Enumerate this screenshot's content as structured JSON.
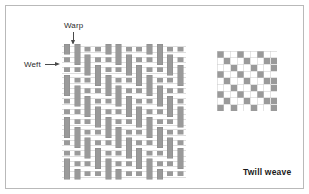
{
  "figure": {
    "caption": "Twill weave",
    "background_color": "#ffffff",
    "border_color": "#b9b9b9",
    "thread_color": "#9a9a9a",
    "thread_outline_color": "#8a8a8a",
    "grid_line_color": "#c9c9c9",
    "weft_line_color": "#bdbdbd",
    "text_color": "#2b2b2b"
  },
  "labels": {
    "warp": "Warp",
    "weft": "Weft"
  },
  "icons": {
    "warp_arrow": "arrow-down-icon",
    "weft_arrow": "arrow-right-icon"
  },
  "chart_data": {
    "type": "heatmap",
    "title": "Twill weave",
    "xlabel": "Warp",
    "ylabel": "Weft",
    "weave_name": "Twill weave",
    "repeat": 4,
    "warp_float": 2,
    "weft_float": 2,
    "step": 1,
    "notation": "2/2 twill, S-direction step 1",
    "grid": {
      "columns": 9,
      "rows": 9,
      "cell_px": 6.6,
      "filled_value": 1,
      "empty_value": 0,
      "filled_color": "#9a9a9a",
      "empty_color": "#ffffff",
      "line_color": "#c9c9c9",
      "legend": [
        {
          "value": 1,
          "label": "warp over weft",
          "color": "#9a9a9a"
        },
        {
          "value": 0,
          "label": "weft over warp",
          "color": "#ffffff"
        }
      ],
      "matrix": [
        [
          1,
          0,
          0,
          1,
          0,
          0,
          1,
          0,
          0
        ],
        [
          0,
          1,
          0,
          0,
          1,
          0,
          0,
          1,
          1
        ],
        [
          0,
          0,
          1,
          0,
          0,
          1,
          0,
          0,
          1
        ],
        [
          1,
          0,
          0,
          1,
          0,
          0,
          1,
          0,
          0
        ],
        [
          0,
          1,
          0,
          0,
          1,
          0,
          0,
          1,
          1
        ],
        [
          0,
          0,
          1,
          0,
          0,
          1,
          0,
          0,
          1
        ],
        [
          1,
          0,
          0,
          1,
          0,
          0,
          1,
          0,
          0
        ],
        [
          0,
          1,
          0,
          0,
          1,
          0,
          0,
          1,
          1
        ],
        [
          1,
          0,
          1,
          0,
          0,
          1,
          0,
          0,
          1
        ]
      ]
    },
    "illustration": {
      "columns": 12,
      "rows": 13,
      "cell_w": 10.3,
      "cell_h": 10.4,
      "warp_width": 6.2,
      "weft_height": 5.6,
      "description": "Pictorial interlacing: vertical warp threads drawn as grey bars where they pass over the weft; horizontal weft threads drawn as pale bars with thin edges where they pass over the warp."
    }
  }
}
